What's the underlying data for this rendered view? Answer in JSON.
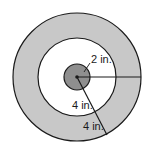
{
  "diagram": {
    "colors": {
      "outer_ring": "#c8c8c8",
      "middle_disk": "#ffffff",
      "center_disk": "#8f8f8f",
      "stroke": "#1a1a1a"
    },
    "labels": {
      "inner_radius": "2 in.",
      "middle_width": "4 in.",
      "outer_width": "4 in."
    },
    "measurements": {
      "inner_radius_in": 2,
      "middle_ring_width_in": 4,
      "outer_ring_width_in": 4
    }
  }
}
